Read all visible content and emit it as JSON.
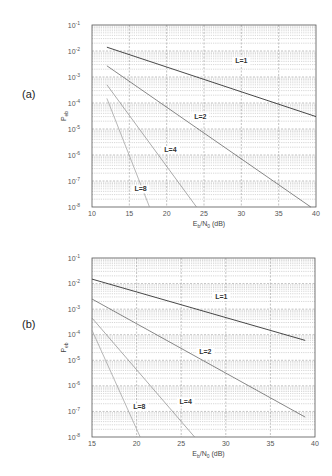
{
  "chart_data": [
    {
      "panel": "(a)",
      "type": "line",
      "xlabel": "E_b/N_0 (dB)",
      "ylabel": "P_eb",
      "xscale": "linear",
      "yscale": "log",
      "xlim": [
        10,
        40
      ],
      "ylim": [
        1e-08,
        0.1
      ],
      "xticks": [
        10,
        15,
        20,
        25,
        30,
        35,
        40
      ],
      "yticks": [
        "10^-1",
        "10^-2",
        "10^-3",
        "10^-4",
        "10^-5",
        "10^-6",
        "10^-7",
        "10^-8"
      ],
      "grid": true,
      "series": [
        {
          "name": "L=1",
          "x": [
            12,
            40
          ],
          "y": [
            0.014,
            3e-05
          ],
          "label_pos": [
            30,
            0.0035
          ],
          "color": "#333333"
        },
        {
          "name": "L=2",
          "x": [
            12,
            39.3
          ],
          "y": [
            0.0027,
            1e-08
          ],
          "label_pos": [
            24.5,
            2.5e-05
          ],
          "color": "#555555"
        },
        {
          "name": "L=4",
          "x": [
            12,
            24
          ],
          "y": [
            0.0005,
            1e-08
          ],
          "label_pos": [
            20.5,
            1.3e-06
          ],
          "color": "#888888"
        },
        {
          "name": "L=8",
          "x": [
            12,
            17.7
          ],
          "y": [
            0.00015,
            1e-08
          ],
          "label_pos": [
            16.5,
            4e-08
          ],
          "color": "#999999"
        }
      ]
    },
    {
      "panel": "(b)",
      "type": "line",
      "xlabel": "E_b/N_0 (dB)",
      "ylabel": "P_eb",
      "xscale": "linear",
      "yscale": "log",
      "xlim": [
        15,
        40
      ],
      "ylim": [
        1e-08,
        0.1
      ],
      "xticks": [
        15,
        20,
        25,
        30,
        35,
        40
      ],
      "yticks": [
        "10^-1",
        "10^-2",
        "10^-3",
        "10^-4",
        "10^-5",
        "10^-6",
        "10^-7",
        "10^-8"
      ],
      "grid": true,
      "series": [
        {
          "name": "L=1",
          "x": [
            15,
            38.9
          ],
          "y": [
            0.015,
            6e-05
          ],
          "label_pos": [
            29.5,
            0.0025
          ],
          "color": "#333333"
        },
        {
          "name": "L=2",
          "x": [
            15,
            38.9
          ],
          "y": [
            0.0025,
            6e-08
          ],
          "label_pos": [
            27.7,
            1.8e-05
          ],
          "color": "#555555"
        },
        {
          "name": "L=4",
          "x": [
            15,
            26.5
          ],
          "y": [
            0.00045,
            1e-08
          ],
          "label_pos": [
            25.5,
            2e-07
          ],
          "color": "#888888"
        },
        {
          "name": "L=8",
          "x": [
            15,
            20.4
          ],
          "y": [
            0.00015,
            1e-08
          ],
          "label_pos": [
            20.3,
            1.2e-07
          ],
          "color": "#999999"
        }
      ]
    }
  ],
  "panels": [
    {
      "label": "(a)",
      "frame": {
        "x0": 92,
        "y0": 25,
        "x1": 316,
        "y1": 207
      }
    },
    {
      "label": "(b)",
      "frame": {
        "x0": 92,
        "y0": 258,
        "x1": 315,
        "y1": 437
      }
    }
  ],
  "axis_text": {
    "xlabel_main": "E",
    "xlabel_sub1": "b",
    "xlabel_mid": "/N",
    "xlabel_sub2": "0",
    "xlabel_tail": " (dB)",
    "ylabel_main": "P",
    "ylabel_sub": "eb"
  },
  "colors": {
    "frame": "#555555",
    "major_grid": "#9a9a9a",
    "minor_grid": "#bcbcbc"
  }
}
